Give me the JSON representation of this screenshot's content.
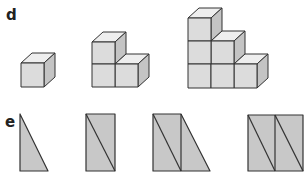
{
  "section_d": {
    "label": "d",
    "description": "Growing staircase of cubes",
    "figures": [
      {
        "name": "stage-1",
        "cube_count": 1,
        "columns": [
          1
        ]
      },
      {
        "name": "stage-2",
        "cube_count": 3,
        "columns": [
          2,
          1
        ]
      },
      {
        "name": "stage-3",
        "cube_count": 6,
        "columns": [
          3,
          2,
          1
        ]
      }
    ]
  },
  "section_e": {
    "label": "e",
    "description": "Growing sequence of right triangles",
    "figures": [
      {
        "name": "stage-1",
        "triangle_count": 1
      },
      {
        "name": "stage-2",
        "triangle_count": 2
      },
      {
        "name": "stage-3",
        "triangle_count": 3
      },
      {
        "name": "stage-4",
        "triangle_count": 4
      }
    ]
  },
  "colors": {
    "face_front": "#dcdcdc",
    "face_top": "#eeeeee",
    "face_side": "#c4c4c4",
    "triangle_fill": "#c8c8c8",
    "stroke": "#333333"
  }
}
